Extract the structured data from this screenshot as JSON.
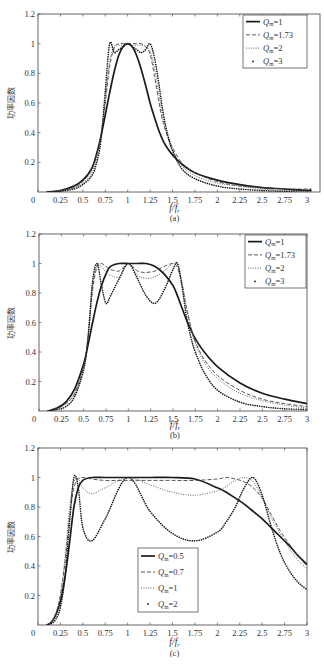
{
  "chart_data": [
    {
      "type": "line",
      "panel": "a",
      "caption": "(a)",
      "xlabel": "f/f_r",
      "ylabel": "功率因数",
      "xlim": [
        0,
        3.05
      ],
      "ylim": [
        0,
        1.2
      ],
      "xticks": [
        "0",
        "0.25",
        "0.5",
        "0.75",
        "1",
        "1.25",
        "1.5",
        "1.75",
        "2",
        "2.25",
        "2.5",
        "2.75",
        "3"
      ],
      "yticks": [
        "0.2",
        "0.4",
        "0.6",
        "0.8",
        "1",
        "1.2"
      ],
      "grid": false,
      "legend_position": "upper right",
      "x": [
        0.1,
        0.25,
        0.4,
        0.5,
        0.6,
        0.65,
        0.7,
        0.75,
        0.8,
        0.85,
        0.9,
        0.95,
        1.0,
        1.05,
        1.1,
        1.15,
        1.2,
        1.25,
        1.3,
        1.35,
        1.4,
        1.45,
        1.5,
        1.6,
        1.75,
        2.0,
        2.25,
        2.5,
        2.75,
        3.0,
        3.05
      ],
      "series": [
        {
          "name": "Q_m=1",
          "style": "solid-thick",
          "values": [
            0.0,
            0.01,
            0.04,
            0.08,
            0.16,
            0.25,
            0.37,
            0.52,
            0.67,
            0.81,
            0.92,
            0.98,
            1.0,
            0.98,
            0.92,
            0.83,
            0.72,
            0.6,
            0.5,
            0.41,
            0.34,
            0.29,
            0.25,
            0.19,
            0.13,
            0.08,
            0.05,
            0.03,
            0.02,
            0.01,
            0.01
          ]
        },
        {
          "name": "Q_m=1.73",
          "style": "dashed",
          "values": [
            0.0,
            0.01,
            0.03,
            0.07,
            0.15,
            0.24,
            0.38,
            0.6,
            0.85,
            0.97,
            1.0,
            1.0,
            1.0,
            1.0,
            1.0,
            1.0,
            0.98,
            0.93,
            0.78,
            0.6,
            0.46,
            0.37,
            0.3,
            0.2,
            0.13,
            0.07,
            0.04,
            0.03,
            0.02,
            0.02,
            0.02
          ]
        },
        {
          "name": "Q_m=2",
          "style": "dotted",
          "values": [
            0.0,
            0.01,
            0.03,
            0.06,
            0.13,
            0.22,
            0.37,
            0.62,
            0.88,
            0.98,
            0.99,
            0.99,
            1.0,
            0.99,
            0.99,
            0.99,
            0.98,
            0.95,
            0.83,
            0.65,
            0.48,
            0.36,
            0.28,
            0.18,
            0.11,
            0.06,
            0.04,
            0.02,
            0.01,
            0.01,
            0.01
          ]
        },
        {
          "name": "Q_m=3",
          "style": "points",
          "values": [
            0.0,
            0.005,
            0.02,
            0.05,
            0.11,
            0.19,
            0.34,
            0.68,
            1.0,
            0.94,
            0.96,
            0.98,
            1.0,
            0.98,
            0.96,
            0.94,
            0.96,
            1.0,
            0.9,
            0.72,
            0.52,
            0.38,
            0.28,
            0.16,
            0.09,
            0.04,
            0.02,
            0.01,
            0.005,
            0.01,
            0.02
          ]
        }
      ]
    },
    {
      "type": "line",
      "panel": "b",
      "caption": "(b)",
      "xlabel": "f/f_r",
      "ylabel": "功率因数",
      "xlim": [
        0,
        3
      ],
      "ylim": [
        0,
        1.2
      ],
      "xticks": [
        "0",
        "0.25",
        "0.5",
        "0.75",
        "1",
        "1.25",
        "1.5",
        "1.75",
        "2",
        "2.25",
        "2.5",
        "2.75",
        "3"
      ],
      "yticks": [
        "0.2",
        "0.4",
        "0.6",
        "0.8",
        "1",
        "1.2"
      ],
      "grid": false,
      "legend_position": "upper right",
      "x": [
        0.1,
        0.2,
        0.3,
        0.4,
        0.5,
        0.55,
        0.6,
        0.65,
        0.7,
        0.75,
        0.8,
        0.9,
        1.0,
        1.1,
        1.2,
        1.3,
        1.4,
        1.5,
        1.55,
        1.6,
        1.65,
        1.7,
        1.75,
        1.85,
        2.0,
        2.25,
        2.5,
        2.75,
        3.0
      ],
      "series": [
        {
          "name": "Q_m=1",
          "style": "solid-thick",
          "values": [
            0.0,
            0.02,
            0.06,
            0.15,
            0.32,
            0.45,
            0.6,
            0.74,
            0.85,
            0.93,
            0.98,
            1.0,
            1.0,
            1.0,
            1.0,
            0.98,
            0.93,
            0.85,
            0.78,
            0.7,
            0.62,
            0.55,
            0.49,
            0.4,
            0.3,
            0.19,
            0.12,
            0.08,
            0.05
          ]
        },
        {
          "name": "Q_m=1.73",
          "style": "dashed",
          "values": [
            0.0,
            0.015,
            0.05,
            0.12,
            0.3,
            0.5,
            0.82,
            0.98,
            1.0,
            0.98,
            0.96,
            0.95,
            1.0,
            0.95,
            0.94,
            0.95,
            0.98,
            1.0,
            0.97,
            0.86,
            0.7,
            0.57,
            0.47,
            0.35,
            0.24,
            0.14,
            0.08,
            0.05,
            0.03
          ]
        },
        {
          "name": "Q_m=2",
          "style": "dotted",
          "values": [
            0.0,
            0.015,
            0.05,
            0.12,
            0.3,
            0.52,
            0.86,
            0.99,
            0.98,
            0.94,
            0.92,
            0.91,
            1.0,
            0.92,
            0.9,
            0.91,
            0.95,
            1.0,
            0.99,
            0.88,
            0.71,
            0.57,
            0.46,
            0.33,
            0.22,
            0.12,
            0.07,
            0.04,
            0.02
          ]
        },
        {
          "name": "Q_m=3",
          "style": "points",
          "values": [
            0.0,
            0.01,
            0.03,
            0.1,
            0.28,
            0.5,
            0.88,
            1.0,
            0.85,
            0.73,
            0.78,
            0.9,
            1.0,
            0.9,
            0.78,
            0.73,
            0.82,
            0.96,
            1.0,
            0.85,
            0.64,
            0.5,
            0.4,
            0.26,
            0.14,
            0.06,
            0.03,
            0.015,
            0.01
          ]
        }
      ]
    },
    {
      "type": "line",
      "panel": "c",
      "caption": "(c)",
      "xlabel": "f/f_r",
      "ylabel": "功率因数",
      "xlim": [
        0,
        3
      ],
      "ylim": [
        0,
        1.2
      ],
      "xticks": [
        "0",
        "0.25",
        "0.5",
        "0.75",
        "1",
        "1.25",
        "1.5",
        "1.75",
        "2",
        "2.25",
        "2.5",
        "2.75",
        "3"
      ],
      "yticks": [
        "0.2",
        "0.4",
        "0.6",
        "0.8",
        "1",
        "1.2"
      ],
      "grid": false,
      "legend_position": "center",
      "x": [
        0.1,
        0.15,
        0.2,
        0.25,
        0.3,
        0.35,
        0.4,
        0.45,
        0.5,
        0.6,
        0.75,
        1.0,
        1.25,
        1.5,
        1.75,
        2.0,
        2.1,
        2.2,
        2.3,
        2.4,
        2.5,
        2.6,
        2.7,
        2.8,
        2.9,
        3.0
      ],
      "series": [
        {
          "name": "Q_m=0.5",
          "style": "solid-thick",
          "values": [
            0.0,
            0.02,
            0.07,
            0.16,
            0.32,
            0.55,
            0.8,
            0.93,
            0.98,
            1.0,
            1.0,
            1.0,
            1.0,
            1.0,
            0.99,
            0.93,
            0.9,
            0.86,
            0.82,
            0.77,
            0.72,
            0.66,
            0.6,
            0.54,
            0.47,
            0.41
          ]
        },
        {
          "name": "Q_m=0.7",
          "style": "dashed",
          "values": [
            0.0,
            0.02,
            0.08,
            0.2,
            0.42,
            0.72,
            0.93,
            0.99,
            1.0,
            0.99,
            0.98,
            0.98,
            0.98,
            0.98,
            0.98,
            0.99,
            1.0,
            0.99,
            0.97,
            0.93,
            0.86,
            0.75,
            0.64,
            0.55,
            0.47,
            0.4
          ]
        },
        {
          "name": "Q_m=1",
          "style": "dotted",
          "values": [
            0.0,
            0.02,
            0.08,
            0.2,
            0.45,
            0.78,
            0.97,
            0.99,
            0.93,
            0.89,
            0.93,
            1.0,
            0.95,
            0.9,
            0.88,
            0.91,
            0.94,
            0.98,
            1.0,
            0.97,
            0.86,
            0.73,
            0.62,
            0.52,
            0.44,
            0.38
          ]
        },
        {
          "name": "Q_m=2",
          "style": "points",
          "values": [
            0.0,
            0.01,
            0.04,
            0.12,
            0.32,
            0.68,
            1.0,
            0.93,
            0.66,
            0.57,
            0.72,
            1.0,
            0.77,
            0.62,
            0.57,
            0.63,
            0.7,
            0.8,
            0.93,
            1.0,
            0.88,
            0.67,
            0.49,
            0.37,
            0.29,
            0.24
          ]
        }
      ]
    }
  ],
  "panels": {
    "a": {
      "caption": "(a)",
      "xlabel_main": "f/f",
      "xlabel_sub": "r",
      "ylabel": "功率因数",
      "legend": [
        {
          "q": "=1"
        },
        {
          "q": "=1.73"
        },
        {
          "q": "=2"
        },
        {
          "q": "=3"
        }
      ]
    },
    "b": {
      "caption": "(b)",
      "xlabel_main": "f/f",
      "xlabel_sub": "r",
      "ylabel": "功率因数",
      "legend": [
        {
          "q": "=1"
        },
        {
          "q": "=1.73"
        },
        {
          "q": "=2"
        },
        {
          "q": "=3"
        }
      ]
    },
    "c": {
      "caption": "(c)",
      "xlabel_main": "f/f",
      "xlabel_sub": "r",
      "ylabel": "功率因数",
      "legend": [
        {
          "q": "=0.5"
        },
        {
          "q": "=0.7"
        },
        {
          "q": "=1"
        },
        {
          "q": "=2"
        }
      ]
    }
  },
  "legend_symbol": {
    "main": "Q",
    "sub": "m"
  },
  "colors": {
    "axis": "#555555",
    "line": "#1a1a1a",
    "background": "#ffffff"
  }
}
